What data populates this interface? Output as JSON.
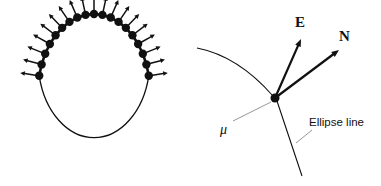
{
  "figure": {
    "background_color": "#ffffff",
    "stroke_color": "#111111",
    "leader_color": "#7a7a7a",
    "width": 381,
    "height": 186
  },
  "left_panel": {
    "name": "ellipse-with-normals",
    "description": "Oval outline discretized into nodes with outward normal arrows",
    "center": {
      "x": 94,
      "y": 92
    },
    "radius_x": 56,
    "radius_y": 78,
    "node_count": 19,
    "node_radius": 4.2,
    "arrow_length": 15,
    "smooth_arc_bottom": true,
    "node_angles_deg": [
      90,
      104,
      118,
      132,
      146,
      160,
      174,
      188,
      202,
      248,
      262,
      276,
      290,
      304,
      318,
      332,
      346,
      360,
      14
    ],
    "nodes": [
      {
        "angle": 270,
        "label": ""
      },
      {
        "angle": 285,
        "label": ""
      },
      {
        "angle": 300,
        "label": ""
      },
      {
        "angle": 315,
        "label": ""
      },
      {
        "angle": 330,
        "label": ""
      },
      {
        "angle": 345,
        "label": ""
      },
      {
        "angle": 0,
        "label": ""
      },
      {
        "angle": 15,
        "label": ""
      },
      {
        "angle": 30,
        "label": ""
      },
      {
        "angle": 45,
        "label": ""
      },
      {
        "angle": 135,
        "label": ""
      },
      {
        "angle": 150,
        "label": ""
      },
      {
        "angle": 165,
        "label": ""
      },
      {
        "angle": 180,
        "label": ""
      },
      {
        "angle": 195,
        "label": ""
      },
      {
        "angle": 210,
        "label": ""
      },
      {
        "angle": 225,
        "label": ""
      },
      {
        "angle": 240,
        "label": ""
      },
      {
        "angle": 255,
        "label": ""
      }
    ]
  },
  "right_panel": {
    "name": "node-detail",
    "description": "Detail view of one ellipse node with E and N vectors",
    "node": {
      "x": 275,
      "y": 98,
      "radius": 4.5
    },
    "vectors": [
      {
        "id": "E",
        "label": "E",
        "tip": {
          "x": 301,
          "y": 39
        },
        "label_pos": {
          "x": 295,
          "y": 14
        },
        "style": "bold-serif"
      },
      {
        "id": "N",
        "label": "N",
        "tip": {
          "x": 339,
          "y": 50
        },
        "label_pos": {
          "x": 339,
          "y": 28
        },
        "style": "bold-serif"
      }
    ],
    "mu": {
      "label": "μ",
      "label_pos": {
        "x": 220,
        "y": 122
      },
      "leader_from": {
        "x": 233,
        "y": 121
      },
      "leader_to": {
        "x": 271,
        "y": 102
      }
    },
    "ellipse_line": {
      "label": "Ellipse line",
      "label_pos": {
        "x": 309,
        "y": 116
      },
      "leader_from": {
        "x": 312,
        "y": 130
      },
      "leader_to": {
        "x": 296,
        "y": 143
      }
    },
    "arc_upper": {
      "from": {
        "x": 197,
        "y": 48
      },
      "ctrl": {
        "x": 238,
        "y": 56
      },
      "to": {
        "x": 273,
        "y": 96
      }
    },
    "arc_lower": {
      "from": {
        "x": 277,
        "y": 101
      },
      "ctrl": {
        "x": 289,
        "y": 137
      },
      "to": {
        "x": 302,
        "y": 176
      }
    }
  }
}
